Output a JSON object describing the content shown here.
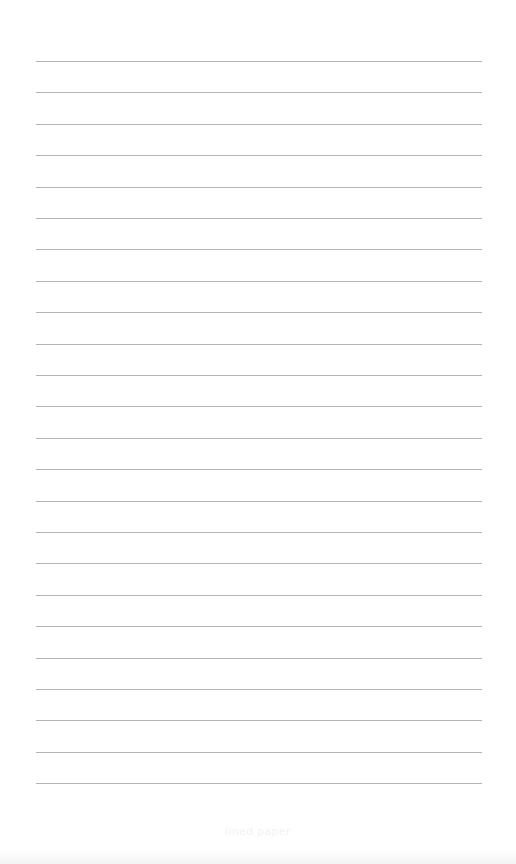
{
  "page": {
    "type": "lined-paper",
    "background_color": "#ffffff",
    "line_color": "#a8a8a8",
    "line_count": 24,
    "line_left_px": 36,
    "line_right_px": 482,
    "first_line_y_px": 61,
    "line_spacing_px": 31.4
  },
  "footer": {
    "text": "lined paper"
  }
}
